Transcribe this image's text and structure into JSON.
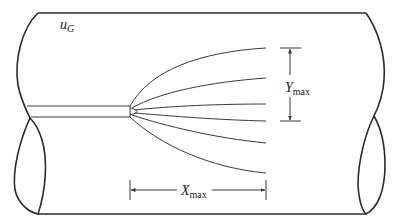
{
  "diagram": {
    "labels": {
      "crossflow_velocity": {
        "main": "u",
        "sub": "G"
      },
      "max_penetration": {
        "main": "Y",
        "sub": "max"
      },
      "max_distance": {
        "main": "X",
        "sub": "max"
      }
    },
    "elements": {
      "duct": "cylindrical pipe section with cut ends",
      "nozzle": "injection tube entering from left",
      "spray_fan": "six spray trajectory lines fanning out from nozzle tip",
      "y_dimension": "vertical dimension bracket with arrows",
      "x_dimension": "horizontal dimension bracket with arrows"
    },
    "colors": {
      "stroke": "#2a2a2a",
      "background": "#ffffff"
    }
  }
}
